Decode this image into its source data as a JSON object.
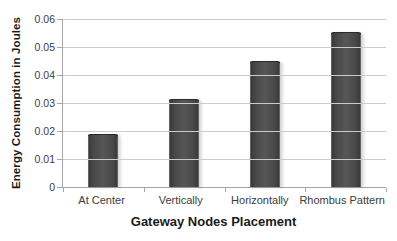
{
  "chart_data": {
    "type": "bar",
    "title": "",
    "categories": [
      "At Center",
      "Vertically",
      "Horizontally",
      "Rhombus Pattern"
    ],
    "values": [
      0.019,
      0.0315,
      0.045,
      0.0555
    ],
    "xlabel": "Gateway Nodes Placement",
    "ylabel": "Energy Consumption in Joules",
    "ylim": [
      0,
      0.06
    ],
    "ytick_interval": 0.01,
    "ytick_labels": [
      "0.06",
      "0.05",
      "0.04",
      "0.03",
      "0.02",
      "0.01",
      "0"
    ],
    "grid": "horizontal",
    "legend_position": "none",
    "bar_color": "#4a4a4a",
    "bar_border_color": "#2b2b2b",
    "gridline_color": "#cbcbcb",
    "axis_color": "#a6a6a6",
    "label_color": "#3c3c3c",
    "title_color": "#1a1a1a",
    "background_color": "#ffffff"
  }
}
